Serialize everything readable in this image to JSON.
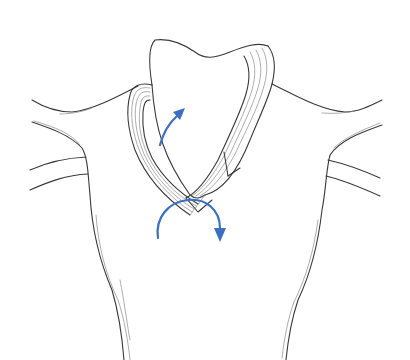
{
  "illustration": {
    "subject": "scarf-knot-tying-step",
    "description": "Line drawing of a torso with a scarf folded around the neck; blue arrows indicate folding and wrapping motion",
    "colors": {
      "outline": "#3a3a3a",
      "detail_lines": "#8a8a8a",
      "arrow": "#3b6fc4",
      "background": "#ffffff"
    },
    "arrows": [
      {
        "name": "fold-up-arrow",
        "direction": "up-right"
      },
      {
        "name": "wrap-around-arrow",
        "direction": "clockwise-down"
      }
    ]
  }
}
